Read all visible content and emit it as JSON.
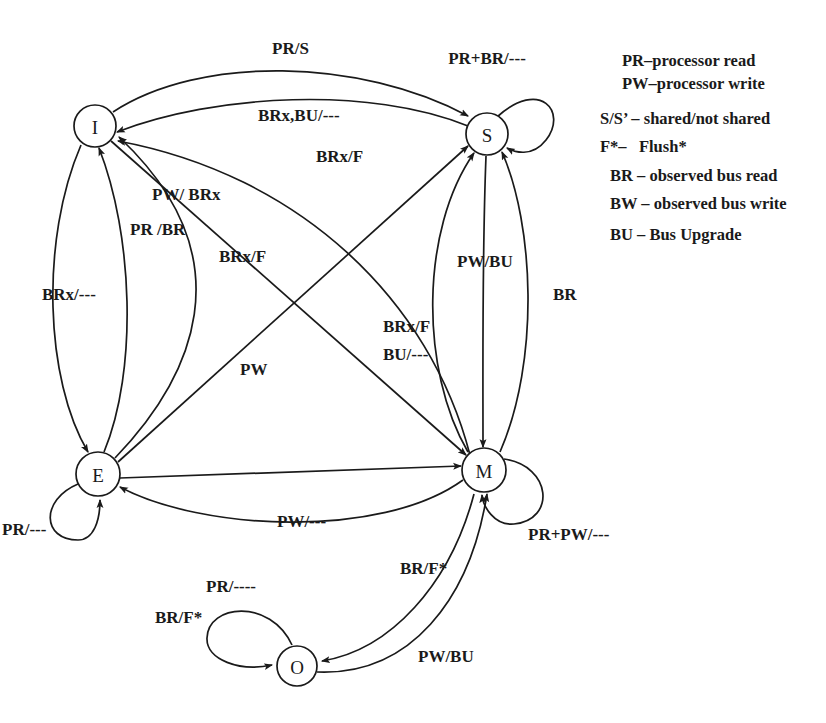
{
  "figure": {
    "background_color": "#ffffff",
    "stroke_color": "#1a1a1a"
  },
  "states": [
    {
      "id": "I",
      "label": "I",
      "name": "Invalid",
      "cx": 95,
      "cy": 126,
      "r": 21
    },
    {
      "id": "S",
      "label": "S",
      "name": "Shared",
      "cx": 487,
      "cy": 134,
      "r": 21
    },
    {
      "id": "E",
      "label": "E",
      "name": "Exclusive",
      "cx": 98,
      "cy": 474,
      "r": 22
    },
    {
      "id": "M",
      "label": "M",
      "name": "Modified",
      "cx": 484,
      "cy": 470,
      "r": 22
    },
    {
      "id": "O",
      "label": "O",
      "name": "Owned",
      "cx": 297,
      "cy": 666,
      "r": 20
    }
  ],
  "self_loops": [
    {
      "id": "s-self",
      "state": "S",
      "label": "PR+BR/---",
      "label_x": 487,
      "label_y": 64
    },
    {
      "id": "m-self",
      "state": "M",
      "label": "PR+PW/---",
      "label_x": 528,
      "label_y": 540
    },
    {
      "id": "e-self",
      "state": "E",
      "label": "PR/---",
      "label_x": 2,
      "label_y": 535
    },
    {
      "id": "o-self",
      "state": "O",
      "label": "PR/----",
      "label_x": 206,
      "label_y": 592
    },
    {
      "id": "o-self2",
      "state": "O",
      "label": "BR/F*",
      "label_x": 188,
      "label_y": 623
    }
  ],
  "edges": [
    {
      "id": "i-to-s-prs",
      "from": "I",
      "to": "S",
      "label": "PR/S",
      "label_x": 272,
      "label_y": 54
    },
    {
      "id": "s-to-i-brxbu",
      "from": "S",
      "to": "I",
      "label": "BRx,BU/---",
      "label_x": 258,
      "label_y": 121
    },
    {
      "id": "m-to-i-brxf",
      "from": "M",
      "to": "I",
      "label": "BRx/F",
      "label_x": 316,
      "label_y": 162
    },
    {
      "id": "i-to-m-pwbrx",
      "from": "I",
      "to": "M",
      "label": "PW/ BRx",
      "label_x": 152,
      "label_y": 200
    },
    {
      "id": "e-to-i-prbr",
      "from": "E",
      "to": "I",
      "label": "PR /BR",
      "label_x": 130,
      "label_y": 235
    },
    {
      "id": "i-to-e-brx",
      "from": "I",
      "to": "E",
      "label": "BRx/---",
      "label_x": 42,
      "label_y": 300
    },
    {
      "id": "e-to-i-brxf",
      "from": "E",
      "to": "I",
      "label": "BRx/F",
      "label_x": 251,
      "label_y": 262
    },
    {
      "id": "e-to-s-brxf",
      "from": "E",
      "to": "S",
      "label": "BRx/F",
      "label_x": 383,
      "label_y": 332
    },
    {
      "id": "m-to-s-bu",
      "from": "M",
      "to": "S",
      "label": "BU/---",
      "label_x": 383,
      "label_y": 360
    },
    {
      "id": "s-to-m-pwbu",
      "from": "S",
      "to": "M",
      "label": "PW/BU",
      "label_x": 460,
      "label_y": 267
    },
    {
      "id": "m-to-s-br",
      "from": "M",
      "to": "S",
      "label": "BR",
      "label_x": 560,
      "label_y": 300
    },
    {
      "id": "e-to-m-pw",
      "from": "E",
      "to": "M",
      "label": "PW",
      "label_x": 248,
      "label_y": 375
    },
    {
      "id": "m-to-e-pw",
      "from": "M",
      "to": "E",
      "label": "PW/---",
      "label_x": 277,
      "label_y": 527
    },
    {
      "id": "m-to-o-brf",
      "from": "M",
      "to": "O",
      "label": "BR/F*",
      "label_x": 400,
      "label_y": 574
    },
    {
      "id": "o-to-m-pwbu",
      "from": "O",
      "to": "M",
      "label": "PW/BU",
      "label_x": 418,
      "label_y": 662
    }
  ],
  "legend": {
    "x": 600,
    "y": 66,
    "lines": [
      {
        "id": "legend-pr",
        "text": "PR–processor read",
        "indent": 22
      },
      {
        "id": "legend-pw",
        "text": "PW–processor write",
        "indent": 22
      },
      {
        "id": "legend-ss",
        "text": "S/S’ – shared/not shared",
        "indent": 0
      },
      {
        "id": "legend-f",
        "text": "F*–   Flush*",
        "indent": 0
      },
      {
        "id": "legend-br",
        "text": "BR – observed bus read",
        "indent": 10
      },
      {
        "id": "legend-bw",
        "text": "BW – observed bus write",
        "indent": 10
      },
      {
        "id": "legend-bu",
        "text": "BU – Bus Upgrade",
        "indent": 10
      }
    ]
  }
}
